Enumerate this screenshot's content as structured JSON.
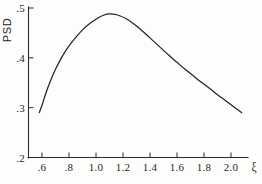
{
  "chart_data": {
    "type": "line",
    "title": "",
    "subtitle": "",
    "xlabel": "ξ",
    "ylabel": "PSD",
    "xlim": [
      0.52,
      2.18
    ],
    "ylim": [
      0.2,
      0.5
    ],
    "grid": false,
    "legend": null,
    "legend_position": "none",
    "x_ticks": [
      0.6,
      0.8,
      1.0,
      1.2,
      1.4,
      1.6,
      1.8,
      2.0
    ],
    "x_tick_labels": [
      ".6",
      ".8",
      "1.0",
      "1.2",
      "1.4",
      "1.6",
      "1.8",
      "2.0"
    ],
    "y_ticks": [
      0.2,
      0.3,
      0.4,
      0.5
    ],
    "y_tick_labels": [
      ".2",
      ".3",
      ".4",
      ".5"
    ],
    "series": [
      {
        "name": "PSD",
        "color": "#242424",
        "x": [
          0.58,
          0.6,
          0.63,
          0.66,
          0.7,
          0.74,
          0.78,
          0.82,
          0.86,
          0.9,
          0.94,
          0.98,
          1.02,
          1.06,
          1.1,
          1.14,
          1.18,
          1.22,
          1.26,
          1.3,
          1.36,
          1.42,
          1.48,
          1.54,
          1.6,
          1.66,
          1.72,
          1.78,
          1.84,
          1.9,
          1.96,
          2.02,
          2.08
        ],
        "y": [
          0.29,
          0.305,
          0.33,
          0.352,
          0.377,
          0.398,
          0.416,
          0.431,
          0.444,
          0.456,
          0.466,
          0.474,
          0.481,
          0.486,
          0.488,
          0.487,
          0.484,
          0.479,
          0.472,
          0.464,
          0.45,
          0.435,
          0.42,
          0.405,
          0.391,
          0.377,
          0.364,
          0.351,
          0.339,
          0.326,
          0.314,
          0.302,
          0.29
        ]
      }
    ],
    "annotations": [],
    "notes": {
      "peak_x": 1.1,
      "peak_y": 0.488,
      "start_point": [
        0.58,
        0.29
      ],
      "end_point": [
        2.08,
        0.29
      ]
    }
  },
  "axes": {
    "y_axis_title": "PSD",
    "x_axis_title": "ξ"
  },
  "style": {
    "background": "#fdfdfc",
    "ink": "#242424",
    "axis_color": "#2b2b2b"
  }
}
